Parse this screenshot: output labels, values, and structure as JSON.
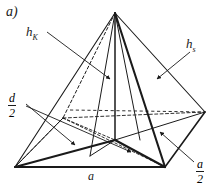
{
  "figure": {
    "part_label": "a)",
    "shape_name": "pyramid",
    "stroke_color": "#1a1a1a",
    "background_color": "#ffffff",
    "labels": {
      "height_body": {
        "base": "h",
        "subscript": "K",
        "full": "h_K"
      },
      "height_slant": {
        "base": "h",
        "subscript": "s",
        "full": "h_s"
      },
      "half_diagonal": {
        "numerator": "d",
        "denominator": "2",
        "full": "d/2"
      },
      "base_edge": {
        "text": "a"
      },
      "half_base_edge": {
        "numerator": "a",
        "denominator": "2",
        "full": "a/2"
      }
    }
  }
}
